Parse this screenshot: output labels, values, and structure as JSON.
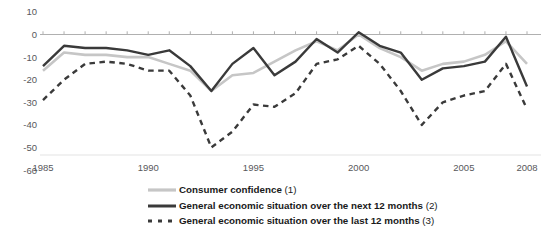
{
  "chart_data": {
    "type": "line",
    "title": "",
    "subtitle": "",
    "xlabel": "",
    "ylabel": "",
    "xlim": [
      1985,
      2008
    ],
    "ylim": [
      -60,
      10
    ],
    "yticks": [
      10,
      0,
      -10,
      -20,
      -30,
      -40,
      -50,
      -60
    ],
    "ytick_labels": [
      "10",
      "0",
      "-10",
      "-20",
      "-30",
      "-40",
      "-50",
      "-60"
    ],
    "xticks": [
      1985,
      1990,
      1995,
      2000,
      2005,
      2008
    ],
    "xtick_labels": [
      "1985",
      "1990",
      "1995",
      "2000",
      "2005",
      "2008"
    ],
    "x": [
      1985,
      1986,
      1987,
      1988,
      1989,
      1990,
      1991,
      1992,
      1993,
      1994,
      1995,
      1996,
      1997,
      1998,
      1999,
      2000,
      2001,
      2002,
      2003,
      2004,
      2005,
      2006,
      2007,
      2008
    ],
    "grid": false,
    "zero_line": true,
    "legend_position": "bottom",
    "series": [
      {
        "name": "Consumer confidence (1)",
        "key": "consumer_confidence",
        "style": "solid",
        "color": "#c6c6c6",
        "width": 2.6,
        "values": [
          -16,
          -8,
          -9,
          -9,
          -10,
          -10,
          -13,
          -16,
          -25,
          -18,
          -17,
          -12,
          -7,
          -3,
          -7,
          0,
          -6,
          -10,
          -16,
          -13,
          -12,
          -9,
          -3,
          -13
        ]
      },
      {
        "name": "General economic situation over the next 12 months (2)",
        "key": "gen_econ_next_12m",
        "style": "solid",
        "color": "#3a3a3a",
        "width": 2.4,
        "values": [
          -14,
          -5,
          -6,
          -6,
          -7,
          -9,
          -7,
          -14,
          -25,
          -13,
          -6,
          -18,
          -12,
          -2,
          -8,
          1,
          -5,
          -8,
          -20,
          -15,
          -14,
          -12,
          -1,
          -23
        ]
      },
      {
        "name": "General economic situation over the last 12 months (3)",
        "key": "gen_econ_last_12m",
        "style": "dashed",
        "color": "#3a3a3a",
        "width": 2.4,
        "values": [
          -29,
          -20,
          -13,
          -12,
          -13,
          -16,
          -16,
          -27,
          -50,
          -43,
          -31,
          -32,
          -26,
          -13,
          -11,
          -5,
          -13,
          -25,
          -40,
          -30,
          -27,
          -25,
          -13,
          -33
        ]
      }
    ]
  },
  "legend": {
    "items": [
      {
        "label": "Consumer confidence",
        "note": "(1)"
      },
      {
        "label": "General economic situation over the next 12 months",
        "note": "(2)"
      },
      {
        "label": "General economic situation over the last 12 months",
        "note": "(3)"
      }
    ]
  },
  "colors": {
    "light_gray_series": "#c6c6c6",
    "dark_series": "#3a3a3a",
    "axis": "#b0b0b0",
    "tick_text": "#58585b",
    "background": "#ffffff"
  }
}
